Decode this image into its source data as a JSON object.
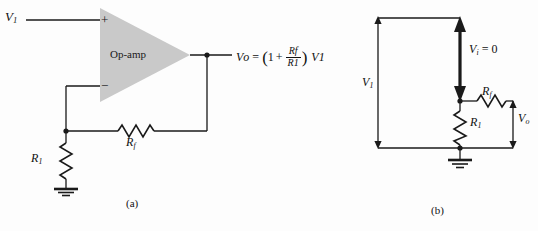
{
  "figure": {
    "background_color": "#fdfdfd",
    "line_color": "#1a1a1a",
    "opamp_fill_color": "#c8c8c8",
    "captions": {
      "a": "(a)",
      "b": "(b)"
    }
  },
  "circuit_a": {
    "input_label": {
      "symbol": "V",
      "subscript": "1"
    },
    "opamp_label": "Op-amp",
    "plus_terminal": "+",
    "minus_terminal": "−",
    "feedback_resistor": {
      "symbol": "R",
      "subscript": "f"
    },
    "input_resistor": {
      "symbol": "R",
      "subscript": "1"
    },
    "output_equation": {
      "lhs_symbol": "V",
      "lhs_subscript": "o",
      "equals": "=",
      "open_paren": "(",
      "one": "1",
      "plus": "+",
      "fraction_numerator_symbol": "R",
      "fraction_numerator_subscript": "f",
      "fraction_denominator_symbol": "R",
      "fraction_denominator_subscript": "1",
      "close_paren": ")",
      "rhs_symbol": "V",
      "rhs_subscript": "1",
      "plain_text": "Vo = (1 + Rf/R1) V1"
    }
  },
  "circuit_b": {
    "source_label": {
      "symbol": "V",
      "subscript": "1"
    },
    "differential_label": {
      "symbol": "V",
      "subscript": "i",
      "equals": "= 0",
      "plain_text": "Vi = 0"
    },
    "input_resistor": {
      "symbol": "R",
      "subscript": "1"
    },
    "feedback_resistor": {
      "symbol": "R",
      "subscript": "f"
    },
    "output_label": {
      "symbol": "V",
      "subscript": "o"
    }
  },
  "icons": {
    "ground_a": "ground-icon",
    "ground_b": "ground-icon",
    "junction_dot": "junction-dot-icon",
    "resistor": "resistor-zigzag-icon",
    "arrow_double": "double-arrow-icon"
  }
}
